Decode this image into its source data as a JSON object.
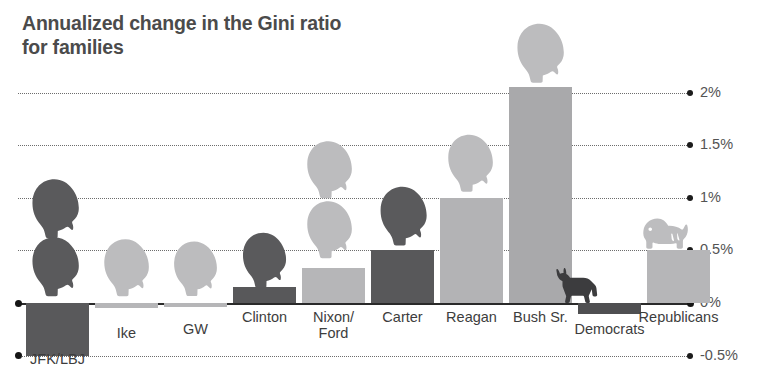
{
  "chart_data": {
    "type": "bar",
    "title": "Annualized change in the Gini ratio\nfor families",
    "xlabel": "",
    "ylabel": "",
    "ylim": [
      -0.6,
      2.3
    ],
    "grid": true,
    "grid_style": "dotted-horizontal-right-labeled",
    "legend": "none",
    "y_ticks": [
      "2%",
      "1.5%",
      "1%",
      "0.5%",
      "0%",
      "-0.5%"
    ],
    "y_tick_values": [
      2,
      1.5,
      1,
      0.5,
      0,
      -0.5
    ],
    "categories": [
      "JFK/LBJ",
      "Ike",
      "GW",
      "Clinton",
      "Nixon/\nFord",
      "Carter",
      "Reagan",
      "Bush Sr.",
      "Democrats",
      "Republicans"
    ],
    "values": [
      -0.5,
      -0.05,
      -0.04,
      0.15,
      0.33,
      0.5,
      1.0,
      2.05,
      -0.1,
      0.5
    ],
    "value_labels": [
      "-0.5%",
      "-0.05%",
      "-0.04%",
      "0.15%",
      "0.33%",
      "0.5%",
      "1%",
      "2.05%",
      "-0.1%",
      "0.5%"
    ],
    "bar_colors": [
      "#59595b",
      "#b6b6b8",
      "#b6b6b8",
      "#58585a",
      "#b6b6b8",
      "#58585a",
      "#b3b3b5",
      "#a9a9ab",
      "#4f4f51",
      "#b6b6b8"
    ],
    "icons": [
      "president-head-dark-pair-icon",
      "president-head-light-icon",
      "president-head-light-icon",
      "president-head-dark-icon",
      "president-head-light-pair-icon",
      "president-head-dark-icon",
      "president-head-light-icon",
      "president-head-light-icon",
      "donkey-dark-icon",
      "elephant-light-icon"
    ]
  },
  "colors": {
    "dark": "#58585a",
    "light": "#b6b6b8",
    "axis": "#2a2a2a",
    "grid": "#6d6d6d",
    "text": "#4b4b4b",
    "background": "#ffffff"
  }
}
